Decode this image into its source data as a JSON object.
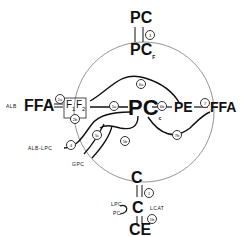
{
  "nodes": {
    "pc_top": "PC",
    "pc_f": "PC",
    "pc_f_sub": "F",
    "alb": "ALB",
    "ffa_left": "FFA",
    "f1": "F",
    "f1_sub": "1",
    "f2": "F",
    "f2_sub": "2",
    "pc_center": "PC",
    "pc_center_sub": "c",
    "pe": "PE",
    "ffa_right": "FFA",
    "alb_lpc": "ALB-LPC",
    "gpc": "GPC",
    "c_top": "C",
    "c_mid": "C",
    "lpc": "LPC",
    "pc_small": "PC",
    "lcat": "LCAT",
    "ce": "CE"
  },
  "reactions": {
    "r3": "3",
    "r2a": "2a",
    "r2b": "2b",
    "r6a": "6a",
    "r5a": "5a",
    "r6b": "6b",
    "r7a": "7",
    "r7b": "7b",
    "r4": "4",
    "r5c": "5c",
    "r5b": "5b",
    "r1": "1",
    "r1b": "1b"
  }
}
